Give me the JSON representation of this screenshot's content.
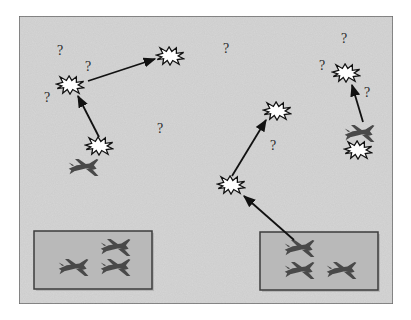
{
  "diagram": {
    "colors": {
      "page_bg": "#ffffff",
      "field_bg": "#d6d6d6",
      "frame_border": "#6e6e6e",
      "base_fill": "#b9b9b9",
      "base_border": "#3c3c3c",
      "jet_fill": "#4a4a4a",
      "arrow": "#111111",
      "explosion_fill": "#ffffff",
      "explosion_stroke": "#111111",
      "question_mark": "#2a2a2a"
    },
    "question_mark_glyph": "?",
    "bases": [
      {
        "id": "base-left",
        "x": 34,
        "y": 231,
        "w": 118,
        "h": 58,
        "jets": 3
      },
      {
        "id": "base-right",
        "x": 260,
        "y": 232,
        "w": 118,
        "h": 58,
        "jets": 3
      }
    ],
    "explosions": [
      {
        "id": "ex-left-upper",
        "x": 70,
        "y": 85
      },
      {
        "id": "ex-top-center",
        "x": 170,
        "y": 56
      },
      {
        "id": "ex-left-lower",
        "x": 99,
        "y": 146
      },
      {
        "id": "ex-mid-upper",
        "x": 277,
        "y": 111
      },
      {
        "id": "ex-mid-lower",
        "x": 231,
        "y": 185
      },
      {
        "id": "ex-right-upper",
        "x": 346,
        "y": 73
      },
      {
        "id": "ex-right-lower",
        "x": 358,
        "y": 150
      }
    ],
    "free_jets": [
      {
        "id": "jet-left",
        "x": 84,
        "y": 167
      },
      {
        "id": "jet-right",
        "x": 360,
        "y": 133
      }
    ],
    "arrows": [
      {
        "id": "arrow-1",
        "from": [
          99,
          137
        ],
        "to": [
          78,
          96
        ]
      },
      {
        "id": "arrow-2",
        "from": [
          88,
          81
        ],
        "to": [
          155,
          59
        ]
      },
      {
        "id": "arrow-3",
        "from": [
          232,
          176
        ],
        "to": [
          266,
          120
        ]
      },
      {
        "id": "arrow-4",
        "from": [
          294,
          240
        ],
        "to": [
          244,
          196
        ]
      },
      {
        "id": "arrow-5",
        "from": [
          363,
          122
        ],
        "to": [
          352,
          85
        ]
      }
    ],
    "question_marks": [
      {
        "x": 60,
        "y": 55
      },
      {
        "x": 88,
        "y": 71
      },
      {
        "x": 47,
        "y": 102
      },
      {
        "x": 160,
        "y": 133
      },
      {
        "x": 226,
        "y": 53
      },
      {
        "x": 273,
        "y": 150
      },
      {
        "x": 344,
        "y": 43
      },
      {
        "x": 322,
        "y": 70
      },
      {
        "x": 367,
        "y": 97
      }
    ]
  }
}
